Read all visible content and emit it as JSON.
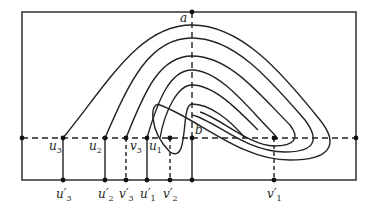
{
  "diagram": {
    "top_label": "a",
    "center_label": "b",
    "upper_labels": [
      {
        "id": "u3",
        "text": "u",
        "sub": "3",
        "x": 49,
        "y": 150
      },
      {
        "id": "u2",
        "text": "u",
        "sub": "2",
        "x": 89,
        "y": 150
      },
      {
        "id": "v3",
        "text": "v",
        "sub": "3",
        "x": 130,
        "y": 150
      },
      {
        "id": "u1",
        "text": "u",
        "sub": "1",
        "x": 149,
        "y": 150
      }
    ],
    "lower_labels": [
      {
        "id": "u3p",
        "text": "u′",
        "sub": "3",
        "x": 56,
        "y": 198
      },
      {
        "id": "u2p",
        "text": "u′",
        "sub": "2",
        "x": 98,
        "y": 198
      },
      {
        "id": "v3p",
        "text": "v′",
        "sub": "3",
        "x": 119,
        "y": 198
      },
      {
        "id": "u1p",
        "text": "u′",
        "sub": "1",
        "x": 140,
        "y": 198
      },
      {
        "id": "v2p",
        "text": "v′",
        "sub": "2",
        "x": 163,
        "y": 198
      },
      {
        "id": "v1p",
        "text": "v′",
        "sub": "1",
        "x": 267,
        "y": 198
      }
    ],
    "stroke_color": "#222222"
  }
}
